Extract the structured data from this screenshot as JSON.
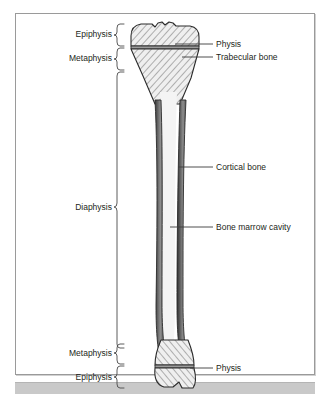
{
  "figure": {
    "background_color": "#ffffff",
    "frame_color": "#9a9a9a",
    "bottom_bar_color": "#c9c9c9",
    "text_color": "#231f20",
    "bone_outline_color": "#2b2b2b",
    "cortical_fill_color": "#6e6e6e",
    "marrow_fill_color": "#f2f2f2",
    "trabecular_fill_color": "#ededed",
    "hatch_color": "#4a4a4a"
  },
  "labels": {
    "left": [
      {
        "id": "epiphysis-proximal",
        "text": "Epiphysis",
        "x": 62,
        "y": 30,
        "brace_top": 24,
        "brace_bottom": 46
      },
      {
        "id": "metaphysis-proximal",
        "text": "Metaphysis",
        "x": 51,
        "y": 52,
        "brace_top": 48,
        "brace_bottom": 70
      },
      {
        "id": "diaphysis",
        "text": "Diaphysis",
        "x": 62,
        "y": 208,
        "brace_top": 72,
        "brace_bottom": 348
      },
      {
        "id": "metaphysis-distal",
        "text": "Metaphysis",
        "x": 51,
        "y": 353,
        "brace_top": 344,
        "brace_bottom": 364
      },
      {
        "id": "epiphysis-distal",
        "text": "Epiphysis",
        "x": 62,
        "y": 377,
        "brace_top": 366,
        "brace_bottom": 388
      }
    ],
    "right": [
      {
        "id": "physis-proximal",
        "text": "Physis",
        "x": 216,
        "y": 41,
        "leader_from_x": 196,
        "leader_from_y": 44,
        "leader_to_x": 175,
        "leader_to_y": 44
      },
      {
        "id": "trabecular-bone",
        "text": "Trabecular bone",
        "x": 216,
        "y": 54,
        "leader_from_x": 196,
        "leader_from_y": 57,
        "leader_to_x": 180,
        "leader_to_y": 57
      },
      {
        "id": "cortical-bone",
        "text": "Cortical bone",
        "x": 216,
        "y": 164,
        "leader_from_x": 214,
        "leader_from_y": 167,
        "leader_to_x": 178,
        "leader_to_y": 167
      },
      {
        "id": "bone-marrow-cavity",
        "text": "Bone marrow cavity",
        "x": 216,
        "y": 224,
        "leader_from_x": 214,
        "leader_from_y": 227,
        "leader_to_x": 170,
        "leader_to_y": 227
      },
      {
        "id": "physis-distal",
        "text": "Physis",
        "x": 216,
        "y": 365,
        "leader_from_x": 214,
        "leader_from_y": 368,
        "leader_to_x": 186,
        "leader_to_y": 368
      }
    ]
  },
  "bone": {
    "name": "tibia",
    "shaft_left_x": 155,
    "shaft_right_x": 180,
    "proximal_top_y": 23,
    "distal_bottom_y": 390,
    "physis_proximal_y": 44,
    "physis_distal_y": 368
  }
}
